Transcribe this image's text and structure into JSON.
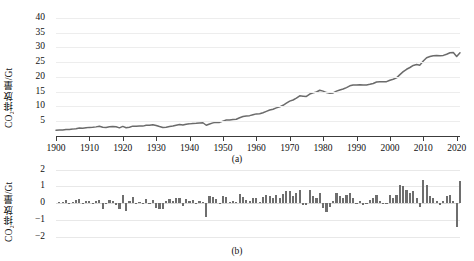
{
  "figure": {
    "background": "#ffffff",
    "line_color": "#6b6b6b",
    "bar_color": "#6e6e6e",
    "grid_color": "#ececec",
    "axis_color": "#3c3c3c"
  },
  "panel_a": {
    "caption": "(a)",
    "ylabel": "CO₂排放量/Gt",
    "yticks": [
      40,
      35,
      30,
      25,
      20,
      15,
      10,
      5
    ],
    "xticks": [
      1900,
      1910,
      1920,
      1930,
      1940,
      1950,
      1960,
      1970,
      1980,
      1990,
      2000,
      2010,
      2020
    ]
  },
  "panel_b": {
    "caption": "(b)",
    "ylabel": "CO₂排放量/Gt",
    "yticks": [
      2,
      1,
      0,
      "−1",
      "−2"
    ]
  },
  "chart_data": [
    {
      "id": "panel-a",
      "type": "line",
      "title": "",
      "subtitle": "(a)",
      "xlabel": "",
      "ylabel": "CO₂排放量/Gt",
      "xlim": [
        1900,
        2021
      ],
      "ylim": [
        0,
        42
      ],
      "ytick_values": [
        5,
        10,
        15,
        20,
        25,
        30,
        35,
        40
      ],
      "xtick_values": [
        1900,
        1910,
        1920,
        1930,
        1940,
        1950,
        1960,
        1970,
        1980,
        1990,
        2000,
        2010,
        2020
      ],
      "grid": "horizontal",
      "legend": "none",
      "x": [
        1900,
        1901,
        1902,
        1903,
        1904,
        1905,
        1906,
        1907,
        1908,
        1909,
        1910,
        1911,
        1912,
        1913,
        1914,
        1915,
        1916,
        1917,
        1918,
        1919,
        1920,
        1921,
        1922,
        1923,
        1924,
        1925,
        1926,
        1927,
        1928,
        1929,
        1930,
        1931,
        1932,
        1933,
        1934,
        1935,
        1936,
        1937,
        1938,
        1939,
        1940,
        1941,
        1942,
        1943,
        1944,
        1945,
        1946,
        1947,
        1948,
        1949,
        1950,
        1951,
        1952,
        1953,
        1954,
        1955,
        1956,
        1957,
        1958,
        1959,
        1960,
        1961,
        1962,
        1963,
        1964,
        1965,
        1966,
        1967,
        1968,
        1969,
        1970,
        1971,
        1972,
        1973,
        1974,
        1975,
        1976,
        1977,
        1978,
        1979,
        1980,
        1981,
        1982,
        1983,
        1984,
        1985,
        1986,
        1987,
        1988,
        1989,
        1990,
        1991,
        1992,
        1993,
        1994,
        1995,
        1996,
        1997,
        1998,
        1999,
        2000,
        2001,
        2002,
        2003,
        2004,
        2005,
        2006,
        2007,
        2008,
        2009,
        2010,
        2011,
        2012,
        2013,
        2014,
        2015,
        2016,
        2017,
        2018,
        2019,
        2020,
        2021
      ],
      "values": [
        1.95,
        2.01,
        2.05,
        2.21,
        2.24,
        2.33,
        2.49,
        2.74,
        2.66,
        2.78,
        2.92,
        2.95,
        3.09,
        3.28,
        2.94,
        2.9,
        3.1,
        3.25,
        3.13,
        2.76,
        3.25,
        2.81,
        2.96,
        3.34,
        3.34,
        3.39,
        3.35,
        3.61,
        3.62,
        3.82,
        3.55,
        3.19,
        2.86,
        2.99,
        3.21,
        3.36,
        3.65,
        3.93,
        3.74,
        4.01,
        4.11,
        4.27,
        4.28,
        4.42,
        4.48,
        3.64,
        4.07,
        4.44,
        4.68,
        4.61,
        5.04,
        5.4,
        5.45,
        5.59,
        5.68,
        6.2,
        6.58,
        6.77,
        6.9,
        7.2,
        7.49,
        7.55,
        7.89,
        8.35,
        8.79,
        9.07,
        9.53,
        9.86,
        10.4,
        11.1,
        11.8,
        12.2,
        12.8,
        13.6,
        13.5,
        13.4,
        14.2,
        14.6,
        14.9,
        15.5,
        15.2,
        14.7,
        14.5,
        14.6,
        15.2,
        15.6,
        15.9,
        16.4,
        17.0,
        17.3,
        17.3,
        17.4,
        17.3,
        17.3,
        17.5,
        17.8,
        18.3,
        18.4,
        18.4,
        18.4,
        18.9,
        19.2,
        19.7,
        20.8,
        21.8,
        22.6,
        23.2,
        23.9,
        24.2,
        24.0,
        25.4,
        26.5,
        26.9,
        27.2,
        27.3,
        27.2,
        27.3,
        27.7,
        28.2,
        28.3,
        26.9,
        28.2
      ],
      "annotations": [
        "Monotonic rise from ~2 Gt in 1900 to ~36 Gt by 2019",
        "Dip at 1945 (end of WWII)",
        "Dip at 2009 (financial crisis)",
        "Sharp dip at 2020 (COVID-19), rebound in 2021"
      ]
    },
    {
      "id": "panel-b",
      "type": "bar",
      "title": "",
      "subtitle": "(b)",
      "xlabel": "",
      "ylabel": "CO₂排放量/Gt",
      "xlim": [
        1900,
        2021
      ],
      "ylim": [
        -2.2,
        2.1
      ],
      "ytick_values": [
        2,
        1,
        0,
        -1,
        -2
      ],
      "grid": "horizontal",
      "legend": "none",
      "description": "Year-on-year change in CO₂ emissions",
      "x": [
        1901,
        1902,
        1903,
        1904,
        1905,
        1906,
        1907,
        1908,
        1909,
        1910,
        1911,
        1912,
        1913,
        1914,
        1915,
        1916,
        1917,
        1918,
        1919,
        1920,
        1921,
        1922,
        1923,
        1924,
        1925,
        1926,
        1927,
        1928,
        1929,
        1930,
        1931,
        1932,
        1933,
        1934,
        1935,
        1936,
        1937,
        1938,
        1939,
        1940,
        1941,
        1942,
        1943,
        1944,
        1945,
        1946,
        1947,
        1948,
        1949,
        1950,
        1951,
        1952,
        1953,
        1954,
        1955,
        1956,
        1957,
        1958,
        1959,
        1960,
        1961,
        1962,
        1963,
        1964,
        1965,
        1966,
        1967,
        1968,
        1969,
        1970,
        1971,
        1972,
        1973,
        1974,
        1975,
        1976,
        1977,
        1978,
        1979,
        1980,
        1981,
        1982,
        1983,
        1984,
        1985,
        1986,
        1987,
        1988,
        1989,
        1990,
        1991,
        1992,
        1993,
        1994,
        1995,
        1996,
        1997,
        1998,
        1999,
        2000,
        2001,
        2002,
        2003,
        2004,
        2005,
        2006,
        2007,
        2008,
        2009,
        2010,
        2011,
        2012,
        2013,
        2014,
        2015,
        2016,
        2017,
        2018,
        2019,
        2020,
        2021
      ],
      "values": [
        0.06,
        0.04,
        0.16,
        0.03,
        0.09,
        0.16,
        0.25,
        -0.08,
        0.12,
        0.14,
        0.03,
        0.14,
        0.19,
        -0.34,
        -0.04,
        0.2,
        0.15,
        -0.12,
        -0.37,
        0.49,
        -0.44,
        0.15,
        0.38,
        0.0,
        0.05,
        -0.04,
        0.26,
        0.01,
        0.2,
        -0.27,
        -0.36,
        -0.33,
        0.13,
        0.22,
        0.15,
        0.29,
        0.28,
        -0.19,
        0.27,
        0.1,
        0.16,
        0.01,
        0.14,
        0.06,
        -0.84,
        0.43,
        0.37,
        0.24,
        -0.07,
        0.43,
        0.36,
        0.05,
        0.14,
        0.09,
        0.52,
        0.38,
        0.19,
        0.13,
        0.3,
        0.29,
        0.06,
        0.34,
        0.46,
        0.44,
        0.28,
        0.46,
        0.33,
        0.54,
        0.7,
        0.7,
        0.4,
        0.6,
        0.8,
        -0.1,
        -0.1,
        0.8,
        0.4,
        0.3,
        0.6,
        -0.3,
        -0.5,
        -0.2,
        0.1,
        0.6,
        0.4,
        0.3,
        0.5,
        0.6,
        0.3,
        0.0,
        0.1,
        -0.1,
        0.0,
        0.2,
        0.3,
        0.5,
        0.1,
        0.0,
        0.0,
        0.5,
        0.3,
        0.5,
        1.1,
        1.0,
        0.8,
        0.6,
        0.7,
        0.3,
        -0.2,
        1.4,
        1.1,
        0.4,
        0.3,
        0.1,
        -0.1,
        0.1,
        0.4,
        0.5,
        0.1,
        -1.4,
        1.3
      ],
      "annotations": [
        "Large negative spike in 1945 (≈ −0.8 Gt)",
        "Largest negative value in 2020 (≈ −2 Gt)",
        "Largest positive values near 2010 and 2021 (≈ +1.4 / +2 Gt)"
      ]
    }
  ]
}
